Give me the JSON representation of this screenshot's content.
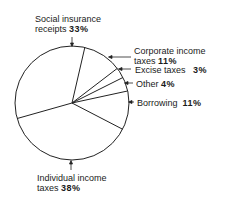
{
  "chart_data": {
    "type": "pie",
    "title": "",
    "slices": [
      {
        "label": "Corporate income taxes",
        "value": 11
      },
      {
        "label": "Excise taxes",
        "value": 3
      },
      {
        "label": "Other",
        "value": 4
      },
      {
        "label": "Borrowing",
        "value": 11
      },
      {
        "label": "Individual income taxes",
        "value": 38
      },
      {
        "label": "Social insurance receipts",
        "value": 33
      }
    ],
    "start_angle_deg": 13,
    "direction": "clockwise",
    "fill": "#ffffff",
    "stroke": "#222222"
  },
  "labels": {
    "social": {
      "line1": "Social insurance",
      "line2": "receipts",
      "pct": "33%"
    },
    "corporate": {
      "line1": "Corporate income",
      "line2": "taxes",
      "pct": "11%"
    },
    "excise": {
      "text": "Excise taxes",
      "pct": "3%"
    },
    "other": {
      "text": "Other",
      "pct": "4%"
    },
    "borrowing": {
      "text": "Borrowing",
      "pct": "11%"
    },
    "individual": {
      "line1": "Individual income",
      "line2": "taxes",
      "pct": "38%"
    }
  }
}
